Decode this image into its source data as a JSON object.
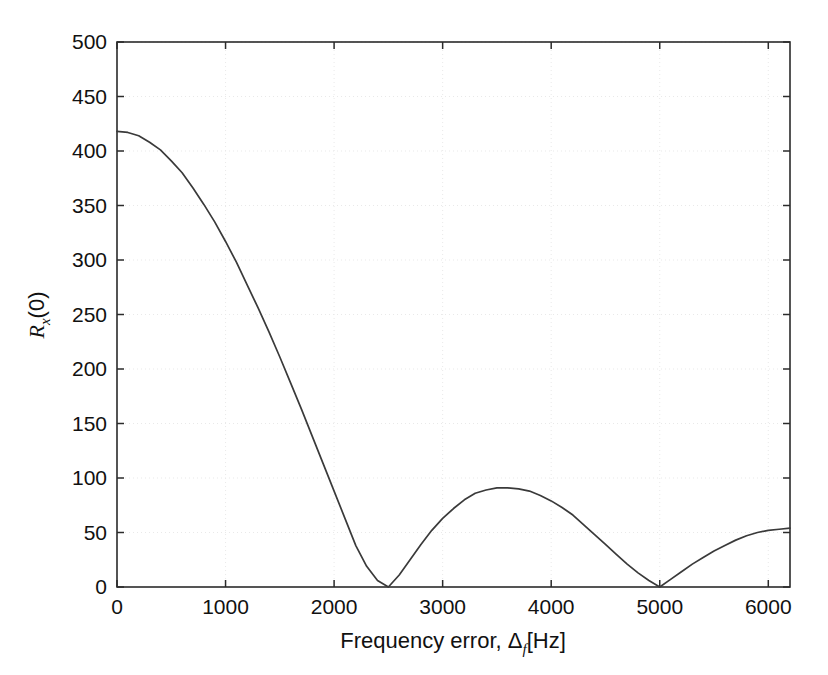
{
  "figure": {
    "background_color": "#ffffff",
    "frame_color": "#2b2b2b",
    "curve_color": "#3a3a3a",
    "grid_color": "#e9e9e9"
  },
  "axes": {
    "x_title_prefix": "Frequency error, ",
    "x_title_symbol": "Δ",
    "x_title_subscript": "f",
    "x_title_suffix": "[Hz]",
    "y_title_main": "R",
    "y_title_subscript": "x",
    "y_title_suffix": "(0)"
  },
  "chart_data": {
    "type": "line",
    "title": "",
    "subtitle": "",
    "xlabel": "Frequency error, Δ_f [Hz]",
    "ylabel": "R_x (0)",
    "xlim": [
      0,
      6200
    ],
    "ylim": [
      0,
      500
    ],
    "xticks": [
      0,
      1000,
      2000,
      3000,
      4000,
      5000,
      6000
    ],
    "xtick_labels": [
      "0",
      "1000",
      "2000",
      "3000",
      "4000",
      "5000",
      "6000"
    ],
    "yticks": [
      0,
      50,
      100,
      150,
      200,
      250,
      300,
      350,
      400,
      450,
      500
    ],
    "ytick_labels": [
      "0",
      "50",
      "100",
      "150",
      "200",
      "250",
      "300",
      "350",
      "400",
      "450",
      "500"
    ],
    "grid": true,
    "legend": null,
    "legend_position": "none",
    "annotations": [],
    "series": [
      {
        "name": "R_x(0) envelope",
        "description": "Rectified sinc-like autocorrelation magnitude with nulls at 2500 Hz and 5000 Hz",
        "color": "#3a3a3a",
        "peak_value": 418,
        "nulls": [
          2500,
          5000
        ],
        "lobe_peaks": [
          {
            "x": 0,
            "y": 418
          },
          {
            "x": 3560,
            "y": 91
          },
          {
            "x": 6200,
            "y": 54
          }
        ],
        "x": [
          0,
          100,
          200,
          300,
          400,
          500,
          600,
          700,
          800,
          900,
          1000,
          1100,
          1200,
          1300,
          1400,
          1500,
          1600,
          1700,
          1800,
          1900,
          2000,
          2100,
          2200,
          2300,
          2400,
          2500,
          2600,
          2700,
          2800,
          2900,
          3000,
          3100,
          3200,
          3300,
          3400,
          3500,
          3600,
          3700,
          3800,
          3900,
          4000,
          4100,
          4200,
          4300,
          4400,
          4500,
          4600,
          4700,
          4800,
          4900,
          5000,
          5100,
          5200,
          5300,
          5400,
          5500,
          5600,
          5700,
          5800,
          5900,
          6000,
          6100,
          6200
        ],
        "y": [
          418,
          417,
          414,
          408,
          401,
          391,
          380,
          366,
          351,
          335,
          317,
          298,
          277,
          256,
          234,
          211,
          187,
          163,
          138,
          113,
          88,
          63,
          38,
          19,
          6,
          0,
          11,
          25,
          39,
          52,
          63,
          72,
          80,
          86,
          89,
          91,
          91,
          90,
          88,
          84,
          79,
          73,
          66,
          57,
          48,
          39,
          30,
          21,
          13,
          6,
          0,
          7,
          14,
          21,
          27,
          33,
          38,
          43,
          47,
          50,
          52,
          53,
          54
        ]
      }
    ]
  }
}
